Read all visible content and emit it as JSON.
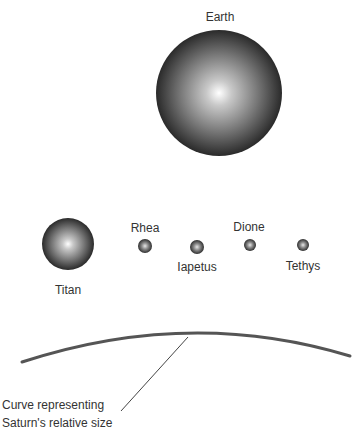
{
  "bodies": {
    "earth": {
      "label": "Earth"
    },
    "titan": {
      "label": "Titan"
    },
    "rhea": {
      "label": "Rhea"
    },
    "iapetus": {
      "label": "Iapetus"
    },
    "dione": {
      "label": "Dione"
    },
    "tethys": {
      "label": "Tethys"
    }
  },
  "caption": {
    "line1": "Curve representing",
    "line2": "Saturn's relative size"
  },
  "colors": {
    "sphere_light": "#ffffff",
    "sphere_dark": "#2a2a2a",
    "curve": "#555555",
    "text": "#333333"
  }
}
